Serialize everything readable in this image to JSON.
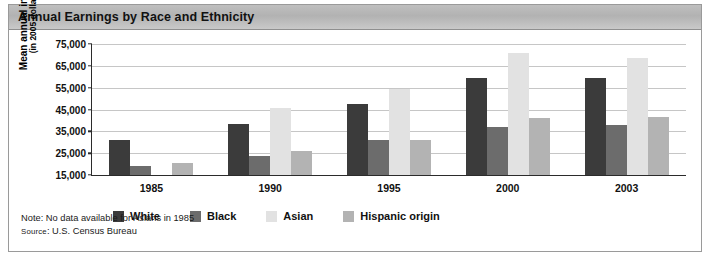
{
  "title": "Annual Earnings by Race and Ethnicity",
  "axis": {
    "y_title_line1": "Mean annual income",
    "y_title_line2": "(in 2005 dollars)"
  },
  "footnotes": {
    "note": "Note: No data available for Asians in 1985",
    "source_prefix": "Source",
    "source_rest": ": U.S. Census Bureau"
  },
  "colors": {
    "white": "#3b3b3b",
    "black": "#6c6c6c",
    "asian": "#e2e2e2",
    "hispanic": "#b3b3b3",
    "gridline": "#c6c6c6",
    "axis": "#2b2b2b",
    "title_band": "#bfbfbf"
  },
  "legend": [
    {
      "label": "White",
      "key": "w"
    },
    {
      "label": "Black",
      "key": "b"
    },
    {
      "label": "Asian",
      "key": "a"
    },
    {
      "label": "Hispanic origin",
      "key": "h"
    }
  ],
  "chart_data": {
    "type": "bar",
    "title": "Annual Earnings by Race and Ethnicity",
    "xlabel": "",
    "ylabel": "Mean annual income (in 2005 dollars)",
    "ylim": [
      15000,
      75000
    ],
    "yticks": [
      15000,
      25000,
      35000,
      45000,
      55000,
      65000,
      75000
    ],
    "ytick_labels": [
      "15,000",
      "25,000",
      "35,000",
      "45,000",
      "55,000",
      "65,000",
      "75,000"
    ],
    "grid": true,
    "legend_position": "bottom",
    "categories": [
      "1985",
      "1990",
      "1995",
      "2000",
      "2003"
    ],
    "series": [
      {
        "name": "White",
        "key": "w",
        "values": [
          31000,
          38500,
          47500,
          59500,
          59500
        ]
      },
      {
        "name": "Black",
        "key": "b",
        "values": [
          19000,
          23500,
          31000,
          37000,
          38000
        ]
      },
      {
        "name": "Asian",
        "key": "a",
        "values": [
          null,
          45500,
          54500,
          71000,
          68500
        ]
      },
      {
        "name": "Hispanic origin",
        "key": "h",
        "values": [
          20500,
          26000,
          31000,
          41000,
          41500
        ]
      }
    ],
    "annotations": [
      "Note: No data available for Asians in 1985",
      "SOURCE: U.S. Census Bureau"
    ]
  }
}
